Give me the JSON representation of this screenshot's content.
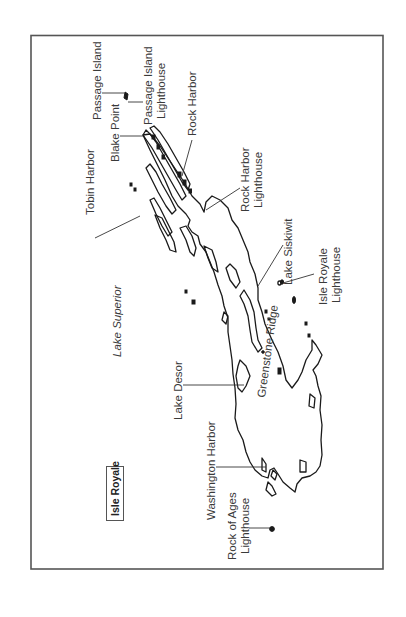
{
  "map": {
    "title": "Isle Royale",
    "orientation": "rotated 90° counter-clockwise (labels read bottom-to-top)",
    "frame": {
      "left": 31,
      "top": 35,
      "right": 383,
      "bottom": 569,
      "stroke": "#555555"
    },
    "colors": {
      "background": "#ffffff",
      "coastline": "#1a1a1a",
      "label": "#3a3a3a"
    },
    "water_body": {
      "label": "Lake Superior",
      "style": "italic"
    },
    "labels": [
      {
        "id": "passage-island",
        "text": "Passage Island",
        "lines": [
          "Passage Island"
        ]
      },
      {
        "id": "passage-island-lighthouse",
        "text": "Passage Island Lighthouse",
        "lines": [
          "Passage Island",
          "Lighthouse"
        ]
      },
      {
        "id": "blake-point",
        "text": "Blake Point",
        "lines": [
          "Blake Point"
        ]
      },
      {
        "id": "rock-harbor",
        "text": "Rock Harbor",
        "lines": [
          "Rock Harbor"
        ]
      },
      {
        "id": "tobin-harbor",
        "text": "Tobin Harbor",
        "lines": [
          "Tobin Harbor"
        ]
      },
      {
        "id": "rock-harbor-lighthouse",
        "text": "Rock Harbor Lighthouse",
        "lines": [
          "Rock Harbor",
          "Lighthouse"
        ]
      },
      {
        "id": "lake-siskiwit",
        "text": "Lake Siskiwit",
        "lines": [
          "Lake Siskiwit"
        ]
      },
      {
        "id": "isle-royale-lighthouse",
        "text": "Isle Royale Lighthouse",
        "lines": [
          "Isle Royale",
          "Lighthouse"
        ]
      },
      {
        "id": "lake-superior",
        "text": "Lake Superior",
        "lines": [
          "Lake Superior"
        ]
      },
      {
        "id": "greenstone-ridge",
        "text": "Greenstone Ridge",
        "lines": [
          "Greenstone Ridge"
        ]
      },
      {
        "id": "lake-desor",
        "text": "Lake Desor",
        "lines": [
          "Lake Desor"
        ]
      },
      {
        "id": "washington-harbor",
        "text": "Washington Harbor",
        "lines": [
          "Washington Harbor"
        ]
      },
      {
        "id": "rock-of-ages-lighthouse",
        "text": "Rock of Ages Lighthouse",
        "lines": [
          "Rock of Ages",
          "Lighthouse"
        ]
      }
    ],
    "legend_box": {
      "text": "Isle Royale"
    }
  }
}
